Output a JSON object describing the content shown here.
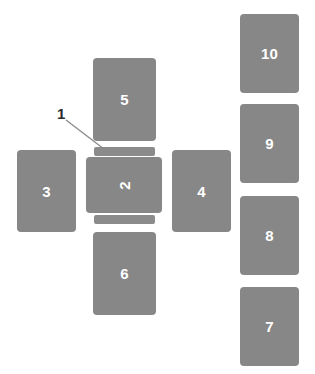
{
  "figure": {
    "width": 315,
    "height": 374,
    "background_color": "#ffffff",
    "part_fill_color": "#878787",
    "bar_fill_color": "#8b8b8b",
    "part_label_color": "#ffffff",
    "callout_color": "#2a2a2a",
    "leader_line_color": "#8d8d8d"
  },
  "callouts": [
    {
      "id": "callout-1",
      "label": "1"
    }
  ],
  "parts": [
    {
      "id": "part-2",
      "label": "2",
      "rotated": true
    },
    {
      "id": "part-3",
      "label": "3",
      "rotated": false
    },
    {
      "id": "part-4",
      "label": "4",
      "rotated": false
    },
    {
      "id": "part-5",
      "label": "5",
      "rotated": false
    },
    {
      "id": "part-6",
      "label": "6",
      "rotated": false
    },
    {
      "id": "part-7",
      "label": "7",
      "rotated": false
    },
    {
      "id": "part-8",
      "label": "8",
      "rotated": false
    },
    {
      "id": "part-9",
      "label": "9",
      "rotated": false
    },
    {
      "id": "part-10",
      "label": "10",
      "rotated": false
    }
  ],
  "bars": [
    {
      "id": "bar-top",
      "label": ""
    },
    {
      "id": "bar-bottom",
      "label": ""
    }
  ]
}
